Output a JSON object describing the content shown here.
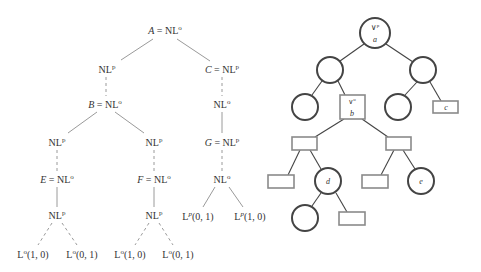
{
  "left_tree": {
    "nodes": {
      "A": {
        "var": "A",
        "eq": " = NL",
        "sup": "o"
      },
      "n1": {
        "var": "",
        "eq": "NL",
        "sup": "p"
      },
      "C": {
        "var": "C",
        "eq": " = NL",
        "sup": "p"
      },
      "B": {
        "var": "B",
        "eq": " = NL",
        "sup": "o"
      },
      "n2": {
        "var": "",
        "eq": "NL",
        "sup": "o"
      },
      "n3": {
        "var": "",
        "eq": "NL",
        "sup": "p"
      },
      "n4": {
        "var": "",
        "eq": "NL",
        "sup": "p"
      },
      "G": {
        "var": "G",
        "eq": " = NL",
        "sup": "p"
      },
      "E": {
        "var": "E",
        "eq": " = NL",
        "sup": "o"
      },
      "F": {
        "var": "F",
        "eq": " = NL",
        "sup": "o"
      },
      "n5": {
        "var": "",
        "eq": "NL",
        "sup": "o"
      },
      "n6": {
        "var": "",
        "eq": "NL",
        "sup": "p"
      },
      "n7": {
        "var": "",
        "eq": "NL",
        "sup": "p"
      },
      "l1": {
        "base": "L",
        "sup": "p",
        "args": "(0, 1)"
      },
      "l2": {
        "base": "L",
        "sup": "p",
        "args": "(1, 0)"
      },
      "l3": {
        "base": "L",
        "sup": "o",
        "args": "(1, 0)"
      },
      "l4": {
        "base": "L",
        "sup": "o",
        "args": "(0, 1)"
      },
      "l5": {
        "base": "L",
        "sup": "o",
        "args": "(1, 0)"
      },
      "l6": {
        "base": "L",
        "sup": "o",
        "args": "(0, 1)"
      }
    }
  },
  "right_tree": {
    "root": {
      "op": "∨",
      "sup": "p",
      "label": "a"
    },
    "square_b": {
      "op": "∨",
      "sup": "o",
      "label": "b"
    },
    "rect_c": {
      "label": "c"
    },
    "circle_d": {
      "label": "d"
    },
    "circle_e": {
      "label": "e"
    }
  }
}
